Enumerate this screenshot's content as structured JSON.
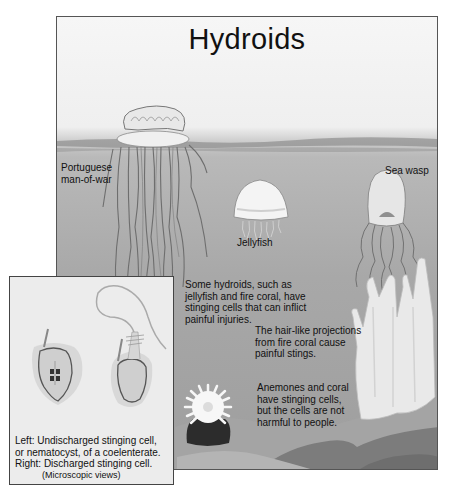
{
  "diagram": {
    "title": "Hydroids",
    "colors": {
      "sky": "#f2f2f2",
      "water": "#a8a8a8",
      "seafloor": "#8a8a8a",
      "creature": "#e6e6e6",
      "outline": "#555555"
    },
    "creatures": [
      {
        "id": "man-of-war",
        "label": "Portuguese\nman-of-war"
      },
      {
        "id": "sea-wasp",
        "label": "Sea wasp"
      },
      {
        "id": "jellyfish",
        "label": "Jellyfish"
      }
    ],
    "annotations": {
      "hydroids_note": "Some hydroids, such as\njellyfish and fire coral, have\nstinging cells that can inflict\npainful injuries.",
      "fire_coral_note": "The hair-like projections\nfrom fire coral cause\npainful stings.",
      "anemone_note": "Anemones and coral\nhave stinging cells,\nbut the cells are not\nharmful to people."
    },
    "inset": {
      "caption": "Left: Undischarged stinging cell,\nor nematocyst, of a coelenterate.\nRight: Discharged stinging cell.",
      "subcaption": "(Microscopic views)"
    }
  }
}
